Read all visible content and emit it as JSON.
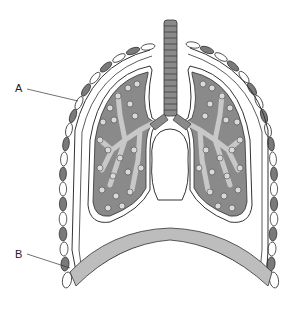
{
  "diagram": {
    "labels": [
      {
        "id": "A",
        "text": "A",
        "x": 16,
        "y": 84,
        "points_to": "pleural membrane / chest wall near upper left ribs"
      },
      {
        "id": "B",
        "text": "B",
        "x": 16,
        "y": 250,
        "points_to": "diaphragm region at lower left"
      }
    ],
    "parts": [
      "trachea",
      "bronchi",
      "left lung",
      "right lung",
      "bronchioles",
      "alveoli",
      "ribs",
      "pleural membranes",
      "diaphragm",
      "heart space"
    ],
    "colors": {
      "lung_tissue": "#8a8a8a",
      "airway": "#c8c8c8",
      "alveoli": "#d9d9d9",
      "rib_dark": "#7a7a7a",
      "rib_light": "#ffffff",
      "diaphragm": "#bdbdbd",
      "outline": "#333333"
    }
  }
}
